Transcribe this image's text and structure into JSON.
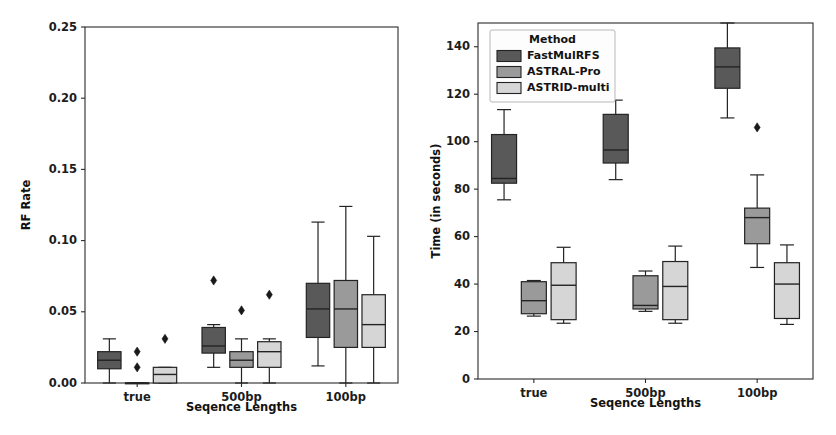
{
  "figure": {
    "background": "#ffffff",
    "panel_count": 2
  },
  "series_colors": {
    "FastMulRFS": "#595959",
    "ASTRAL-Pro": "#9a9a9a",
    "ASTRID-multi": "#d6d6d6"
  },
  "legend": {
    "title": "Method",
    "position": "upper-left",
    "panel": "right",
    "entries": [
      {
        "label": "FastMulRFS",
        "color": "#595959"
      },
      {
        "label": "ASTRAL-Pro",
        "color": "#9a9a9a"
      },
      {
        "label": "ASTRID-multi",
        "color": "#d6d6d6"
      }
    ]
  },
  "chart_data": [
    {
      "id": "left",
      "type": "box",
      "title": "",
      "xlabel": "Seqence Lengths",
      "ylabel": "RF Rate",
      "categories": [
        "true",
        "500bp",
        "100bp"
      ],
      "ylim": [
        0.0,
        0.25
      ],
      "yticks": [
        0.0,
        0.05,
        0.1,
        0.15,
        0.2,
        0.25
      ],
      "ytick_labels": [
        "0.00",
        "0.05",
        "0.10",
        "0.15",
        "0.20",
        "0.25"
      ],
      "grid": false,
      "legend": false,
      "series": [
        {
          "name": "FastMulRFS",
          "color": "#595959",
          "boxes": [
            {
              "category": "true",
              "whisker_low": 0.0,
              "q1": 0.01,
              "median": 0.016,
              "q3": 0.022,
              "whisker_high": 0.031,
              "fliers": []
            },
            {
              "category": "500bp",
              "whisker_low": 0.011,
              "q1": 0.021,
              "median": 0.026,
              "q3": 0.039,
              "whisker_high": 0.041,
              "fliers": [
                0.072
              ]
            },
            {
              "category": "100bp",
              "whisker_low": 0.012,
              "q1": 0.032,
              "median": 0.052,
              "q3": 0.07,
              "whisker_high": 0.113,
              "fliers": []
            }
          ]
        },
        {
          "name": "ASTRAL-Pro",
          "color": "#9a9a9a",
          "boxes": [
            {
              "category": "true",
              "whisker_low": 0.0,
              "q1": 0.0,
              "median": 0.0,
              "q3": 0.0,
              "whisker_high": 0.0,
              "fliers": [
                0.011,
                0.022
              ]
            },
            {
              "category": "500bp",
              "whisker_low": 0.0,
              "q1": 0.011,
              "median": 0.016,
              "q3": 0.022,
              "whisker_high": 0.031,
              "fliers": [
                0.051
              ]
            },
            {
              "category": "100bp",
              "whisker_low": 0.0,
              "q1": 0.025,
              "median": 0.052,
              "q3": 0.072,
              "whisker_high": 0.124,
              "fliers": []
            }
          ]
        },
        {
          "name": "ASTRID-multi",
          "color": "#d6d6d6",
          "boxes": [
            {
              "category": "true",
              "whisker_low": 0.0,
              "q1": 0.0,
              "median": 0.006,
              "q3": 0.011,
              "whisker_high": 0.011,
              "fliers": [
                0.031
              ]
            },
            {
              "category": "500bp",
              "whisker_low": 0.0,
              "q1": 0.011,
              "median": 0.022,
              "q3": 0.029,
              "whisker_high": 0.031,
              "fliers": [
                0.062
              ]
            },
            {
              "category": "100bp",
              "whisker_low": 0.0,
              "q1": 0.025,
              "median": 0.041,
              "q3": 0.062,
              "whisker_high": 0.103,
              "fliers": []
            }
          ]
        }
      ]
    },
    {
      "id": "right",
      "type": "box",
      "title": "",
      "xlabel": "Seqence Lengths",
      "ylabel": "Time (in seconds)",
      "categories": [
        "true",
        "500bp",
        "100bp"
      ],
      "ylim": [
        0,
        150
      ],
      "yticks": [
        0,
        20,
        40,
        60,
        80,
        100,
        120,
        140
      ],
      "ytick_labels": [
        "0",
        "20",
        "40",
        "60",
        "80",
        "100",
        "120",
        "140"
      ],
      "grid": false,
      "legend": true,
      "series": [
        {
          "name": "FastMulRFS",
          "color": "#595959",
          "boxes": [
            {
              "category": "true",
              "whisker_low": 75.5,
              "q1": 82.5,
              "median": 84.5,
              "q3": 103.0,
              "whisker_high": 113.5,
              "fliers": []
            },
            {
              "category": "500bp",
              "whisker_low": 84.0,
              "q1": 91.0,
              "median": 96.5,
              "q3": 111.5,
              "whisker_high": 117.5,
              "fliers": []
            },
            {
              "category": "100bp",
              "whisker_low": 110.0,
              "q1": 122.5,
              "median": 131.5,
              "q3": 139.5,
              "whisker_high": 150.0,
              "fliers": []
            }
          ]
        },
        {
          "name": "ASTRAL-Pro",
          "color": "#9a9a9a",
          "boxes": [
            {
              "category": "true",
              "whisker_low": 26.5,
              "q1": 27.5,
              "median": 33.0,
              "q3": 41.0,
              "whisker_high": 41.5,
              "fliers": []
            },
            {
              "category": "500bp",
              "whisker_low": 28.5,
              "q1": 29.5,
              "median": 31.0,
              "q3": 43.5,
              "whisker_high": 45.5,
              "fliers": []
            },
            {
              "category": "100bp",
              "whisker_low": 47.0,
              "q1": 57.0,
              "median": 68.0,
              "q3": 72.0,
              "whisker_high": 86.0,
              "fliers": [
                106.0
              ]
            }
          ]
        },
        {
          "name": "ASTRID-multi",
          "color": "#d6d6d6",
          "boxes": [
            {
              "category": "true",
              "whisker_low": 23.5,
              "q1": 25.0,
              "median": 39.5,
              "q3": 49.0,
              "whisker_high": 55.5,
              "fliers": []
            },
            {
              "category": "500bp",
              "whisker_low": 23.5,
              "q1": 25.0,
              "median": 39.0,
              "q3": 49.5,
              "whisker_high": 56.0,
              "fliers": []
            },
            {
              "category": "100bp",
              "whisker_low": 23.0,
              "q1": 25.5,
              "median": 40.0,
              "q3": 49.0,
              "whisker_high": 56.5,
              "fliers": []
            }
          ]
        }
      ]
    }
  ]
}
